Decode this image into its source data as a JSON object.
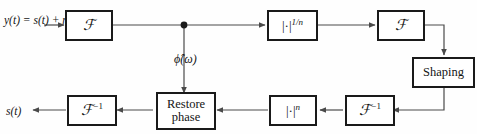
{
  "diagram": {
    "background_color": "#fefefe",
    "line_color": "#4a4a4a",
    "box_border_color": "#1a1a1a",
    "text_color": "#141414",
    "input_label": "y(t) =\ns(t) + n(t)",
    "output_label": "s(t)",
    "branch_label": "ϕ̂(ω)",
    "blocks": [
      {
        "id": "fourier-forward-1",
        "label": "ℱ",
        "name": "fourier-transform-block"
      },
      {
        "id": "magnitude-root",
        "label": "|·| 1/n",
        "name": "magnitude-root-block"
      },
      {
        "id": "fourier-forward-2",
        "label": "ℱ",
        "name": "fourier-transform-block"
      },
      {
        "id": "shaping",
        "label": "Shaping",
        "name": "shaping-block"
      },
      {
        "id": "fourier-inverse-1",
        "label": "ℱ⁻¹",
        "name": "inverse-fourier-block"
      },
      {
        "id": "magnitude-power",
        "label": "|·| n",
        "name": "magnitude-power-block"
      },
      {
        "id": "restore-phase",
        "label": "Restore\nphase",
        "name": "restore-phase-block"
      },
      {
        "id": "fourier-inverse-2",
        "label": "ℱ⁻¹",
        "name": "inverse-fourier-block"
      }
    ]
  }
}
